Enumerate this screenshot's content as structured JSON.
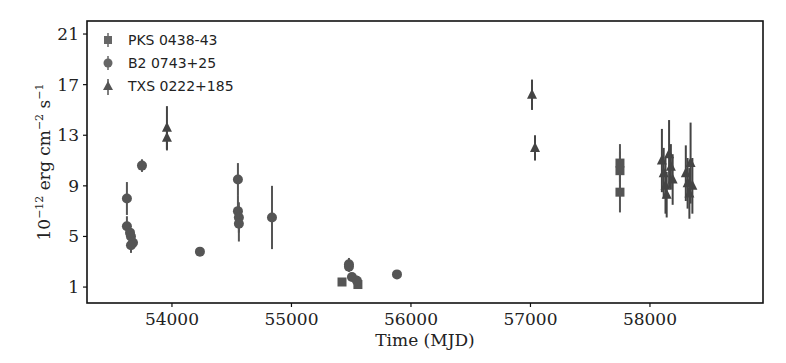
{
  "chart_data": {
    "type": "scatter",
    "title": "",
    "xlabel": "Time (MJD)",
    "ylabel": "10^-12 erg cm^-2 s^-1",
    "xlim": [
      53289,
      58946
    ],
    "ylim": [
      -0.26,
      22.03
    ],
    "xticks": [
      54000,
      55000,
      56000,
      57000,
      58000
    ],
    "yticks": [
      1,
      5,
      9,
      13,
      17,
      21
    ],
    "grid": false,
    "legend_position": "upper left",
    "series": [
      {
        "name": "PKS 0438-43",
        "marker": "square",
        "color": "#555555",
        "points": [
          {
            "x": 55423,
            "y": 1.4,
            "err": 0.2
          },
          {
            "x": 55556,
            "y": 1.2,
            "err": 0.3
          },
          {
            "x": 57749,
            "y": 10.8,
            "err": 1.5
          },
          {
            "x": 57749,
            "y": 10.2,
            "err": 1.5
          },
          {
            "x": 57749,
            "y": 8.5,
            "err": 1.6
          }
        ]
      },
      {
        "name": "B2 0743+25",
        "marker": "circle",
        "color": "#555555",
        "points": [
          {
            "x": 53623,
            "y": 8.0,
            "err": 1.3
          },
          {
            "x": 53623,
            "y": 5.8,
            "err": 0.8
          },
          {
            "x": 53649,
            "y": 5.3,
            "err": 0.6
          },
          {
            "x": 53657,
            "y": 5.0,
            "err": 0.6
          },
          {
            "x": 53674,
            "y": 4.5,
            "err": 0.5
          },
          {
            "x": 53657,
            "y": 4.3,
            "err": 0.6
          },
          {
            "x": 53749,
            "y": 10.6,
            "err": 0.5
          },
          {
            "x": 54234,
            "y": 3.8,
            "err": 0.2
          },
          {
            "x": 54552,
            "y": 9.5,
            "err": 1.3
          },
          {
            "x": 54552,
            "y": 7.0,
            "err": 1.2
          },
          {
            "x": 54560,
            "y": 6.5,
            "err": 1.2
          },
          {
            "x": 54560,
            "y": 6.0,
            "err": 1.4
          },
          {
            "x": 54837,
            "y": 6.5,
            "err": 2.5
          },
          {
            "x": 55481,
            "y": 2.8,
            "err": 0.5
          },
          {
            "x": 55481,
            "y": 2.6,
            "err": 0.4
          },
          {
            "x": 55506,
            "y": 1.8,
            "err": 0.3
          },
          {
            "x": 55548,
            "y": 1.5,
            "err": 0.4
          },
          {
            "x": 55883,
            "y": 2.0,
            "err": 0.3
          }
        ]
      },
      {
        "name": "TXS 0222+185",
        "marker": "triangle",
        "color": "#444444",
        "points": [
          {
            "x": 53958,
            "y": 13.6,
            "err": 1.7
          },
          {
            "x": 53958,
            "y": 12.8,
            "err": 1.0
          },
          {
            "x": 57013,
            "y": 16.2,
            "err": 1.2
          },
          {
            "x": 57038,
            "y": 12.0,
            "err": 1.0
          },
          {
            "x": 58100,
            "y": 11.0,
            "err": 2.5
          },
          {
            "x": 58115,
            "y": 10.0,
            "err": 2.0
          },
          {
            "x": 58130,
            "y": 9.0,
            "err": 2.2
          },
          {
            "x": 58140,
            "y": 8.3,
            "err": 1.8
          },
          {
            "x": 58160,
            "y": 11.5,
            "err": 2.7
          },
          {
            "x": 58175,
            "y": 10.5,
            "err": 1.8
          },
          {
            "x": 58190,
            "y": 9.5,
            "err": 2.0
          },
          {
            "x": 58300,
            "y": 10.0,
            "err": 2.2
          },
          {
            "x": 58315,
            "y": 9.2,
            "err": 2.0
          },
          {
            "x": 58330,
            "y": 8.4,
            "err": 2.0
          },
          {
            "x": 58340,
            "y": 10.8,
            "err": 3.2
          },
          {
            "x": 58355,
            "y": 9.0,
            "err": 2.2
          }
        ]
      }
    ]
  },
  "axes": {
    "xlabel": "Time (MJD)",
    "ylabel_base": "10",
    "ylabel_exp1": "−12",
    "ylabel_mid1": " erg cm",
    "ylabel_exp2": "−2",
    "ylabel_mid2": " s",
    "ylabel_exp3": "−1"
  },
  "legend": {
    "items": [
      {
        "label": "PKS 0438-43",
        "marker": "square"
      },
      {
        "label": "B2 0743+25",
        "marker": "circle"
      },
      {
        "label": "TXS 0222+185",
        "marker": "triangle"
      }
    ]
  }
}
